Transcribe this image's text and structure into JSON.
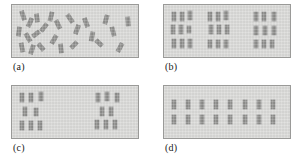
{
  "figure": {
    "background_color": "#ffffff",
    "panel_fill_color": "#d8d8d6",
    "panel_border_color": "#9a9a98",
    "mark_color": "#8c8c8a",
    "panel_width": 128,
    "panel_height": 54
  },
  "panels": [
    {
      "id": "a",
      "label": "(a)",
      "caption_text": "(a)",
      "pattern": "random",
      "origin": {
        "x": 11,
        "y": 4
      },
      "mark_count": 24,
      "marks": [
        {
          "x": 9,
          "y": 6,
          "w": 4,
          "h": 9,
          "rot": -18
        },
        {
          "x": 16,
          "y": 13,
          "w": 4,
          "h": 9,
          "rot": 24
        },
        {
          "x": 23,
          "y": 9,
          "w": 4,
          "h": 8,
          "rot": -8
        },
        {
          "x": 30,
          "y": 18,
          "w": 4,
          "h": 9,
          "rot": 38
        },
        {
          "x": 5,
          "y": 22,
          "w": 4,
          "h": 9,
          "rot": 8
        },
        {
          "x": 14,
          "y": 28,
          "w": 4,
          "h": 9,
          "rot": -30
        },
        {
          "x": 22,
          "y": 25,
          "w": 4,
          "h": 8,
          "rot": 52
        },
        {
          "x": 8,
          "y": 38,
          "w": 4,
          "h": 9,
          "rot": -12
        },
        {
          "x": 18,
          "y": 40,
          "w": 4,
          "h": 9,
          "rot": 18
        },
        {
          "x": 27,
          "y": 38,
          "w": 4,
          "h": 8,
          "rot": -40
        },
        {
          "x": 37,
          "y": 7,
          "w": 4,
          "h": 9,
          "rot": 14
        },
        {
          "x": 44,
          "y": 15,
          "w": 4,
          "h": 9,
          "rot": -26
        },
        {
          "x": 40,
          "y": 30,
          "w": 4,
          "h": 9,
          "rot": 30
        },
        {
          "x": 47,
          "y": 39,
          "w": 4,
          "h": 9,
          "rot": -6
        },
        {
          "x": 56,
          "y": 9,
          "w": 4,
          "h": 9,
          "rot": -34
        },
        {
          "x": 63,
          "y": 20,
          "w": 4,
          "h": 9,
          "rot": 20
        },
        {
          "x": 60,
          "y": 36,
          "w": 4,
          "h": 8,
          "rot": 44
        },
        {
          "x": 72,
          "y": 13,
          "w": 4,
          "h": 9,
          "rot": -20
        },
        {
          "x": 78,
          "y": 27,
          "w": 4,
          "h": 9,
          "rot": 10
        },
        {
          "x": 85,
          "y": 34,
          "w": 4,
          "h": 8,
          "rot": -46
        },
        {
          "x": 92,
          "y": 10,
          "w": 4,
          "h": 9,
          "rot": 16
        },
        {
          "x": 99,
          "y": 22,
          "w": 4,
          "h": 9,
          "rot": -14
        },
        {
          "x": 106,
          "y": 38,
          "w": 4,
          "h": 9,
          "rot": 28
        },
        {
          "x": 114,
          "y": 12,
          "w": 4,
          "h": 9,
          "rot": -4
        }
      ]
    },
    {
      "id": "b",
      "label": "(b)",
      "caption_text": "(b)",
      "pattern": "clustered-three-groups",
      "origin": {
        "x": 163,
        "y": 4
      },
      "mark_count": 27,
      "marks": [
        {
          "x": 8,
          "y": 7,
          "w": 4,
          "h": 9,
          "rot": 0
        },
        {
          "x": 16,
          "y": 7,
          "w": 4,
          "h": 9,
          "rot": 0
        },
        {
          "x": 24,
          "y": 6,
          "w": 4,
          "h": 9,
          "rot": 0
        },
        {
          "x": 7,
          "y": 20,
          "w": 4,
          "h": 9,
          "rot": 0
        },
        {
          "x": 15,
          "y": 20,
          "w": 4,
          "h": 9,
          "rot": 0
        },
        {
          "x": 23,
          "y": 21,
          "w": 4,
          "h": 7,
          "rot": 0
        },
        {
          "x": 8,
          "y": 34,
          "w": 4,
          "h": 9,
          "rot": 0
        },
        {
          "x": 16,
          "y": 34,
          "w": 4,
          "h": 9,
          "rot": 0
        },
        {
          "x": 24,
          "y": 34,
          "w": 4,
          "h": 9,
          "rot": 0
        },
        {
          "x": 44,
          "y": 7,
          "w": 4,
          "h": 9,
          "rot": 0
        },
        {
          "x": 52,
          "y": 7,
          "w": 4,
          "h": 9,
          "rot": 0
        },
        {
          "x": 60,
          "y": 6,
          "w": 4,
          "h": 9,
          "rot": 0
        },
        {
          "x": 45,
          "y": 20,
          "w": 4,
          "h": 9,
          "rot": 0
        },
        {
          "x": 53,
          "y": 20,
          "w": 4,
          "h": 9,
          "rot": 0
        },
        {
          "x": 61,
          "y": 20,
          "w": 4,
          "h": 9,
          "rot": 0
        },
        {
          "x": 44,
          "y": 35,
          "w": 4,
          "h": 8,
          "rot": 0
        },
        {
          "x": 52,
          "y": 35,
          "w": 4,
          "h": 8,
          "rot": 0
        },
        {
          "x": 60,
          "y": 35,
          "w": 4,
          "h": 8,
          "rot": 0
        },
        {
          "x": 90,
          "y": 7,
          "w": 4,
          "h": 9,
          "rot": 0
        },
        {
          "x": 98,
          "y": 7,
          "w": 4,
          "h": 9,
          "rot": 0
        },
        {
          "x": 108,
          "y": 7,
          "w": 4,
          "h": 9,
          "rot": 0
        },
        {
          "x": 90,
          "y": 21,
          "w": 4,
          "h": 9,
          "rot": 0
        },
        {
          "x": 99,
          "y": 21,
          "w": 4,
          "h": 9,
          "rot": 0
        },
        {
          "x": 108,
          "y": 21,
          "w": 4,
          "h": 9,
          "rot": 0
        },
        {
          "x": 90,
          "y": 35,
          "w": 4,
          "h": 8,
          "rot": 0
        },
        {
          "x": 98,
          "y": 35,
          "w": 4,
          "h": 8,
          "rot": 0
        },
        {
          "x": 106,
          "y": 35,
          "w": 4,
          "h": 8,
          "rot": 0
        }
      ]
    },
    {
      "id": "c",
      "label": "(c)",
      "caption_text": "(c)",
      "pattern": "clustered-two-groups",
      "origin": {
        "x": 11,
        "y": 85
      },
      "mark_count": 16,
      "marks": [
        {
          "x": 8,
          "y": 7,
          "w": 4,
          "h": 9,
          "rot": 0
        },
        {
          "x": 17,
          "y": 7,
          "w": 4,
          "h": 9,
          "rot": 0
        },
        {
          "x": 27,
          "y": 6,
          "w": 4,
          "h": 9,
          "rot": 0
        },
        {
          "x": 11,
          "y": 21,
          "w": 4,
          "h": 9,
          "rot": 0
        },
        {
          "x": 22,
          "y": 22,
          "w": 4,
          "h": 8,
          "rot": 0
        },
        {
          "x": 8,
          "y": 35,
          "w": 4,
          "h": 9,
          "rot": 0
        },
        {
          "x": 17,
          "y": 35,
          "w": 4,
          "h": 9,
          "rot": 0
        },
        {
          "x": 26,
          "y": 35,
          "w": 4,
          "h": 9,
          "rot": 0
        },
        {
          "x": 84,
          "y": 7,
          "w": 4,
          "h": 9,
          "rot": 0
        },
        {
          "x": 93,
          "y": 6,
          "w": 4,
          "h": 9,
          "rot": 0
        },
        {
          "x": 103,
          "y": 7,
          "w": 4,
          "h": 9,
          "rot": 0
        },
        {
          "x": 88,
          "y": 21,
          "w": 4,
          "h": 9,
          "rot": 0
        },
        {
          "x": 97,
          "y": 21,
          "w": 4,
          "h": 9,
          "rot": 0
        },
        {
          "x": 83,
          "y": 34,
          "w": 4,
          "h": 9,
          "rot": 0
        },
        {
          "x": 92,
          "y": 34,
          "w": 4,
          "h": 9,
          "rot": 0
        },
        {
          "x": 101,
          "y": 34,
          "w": 4,
          "h": 9,
          "rot": 0
        }
      ]
    },
    {
      "id": "d",
      "label": "(d)",
      "caption_text": "(d)",
      "pattern": "regular-grid",
      "origin": {
        "x": 163,
        "y": 85
      },
      "mark_count": 16,
      "grid": {
        "rows": 2,
        "cols": 8
      },
      "marks": [
        {
          "x": 8,
          "y": 14,
          "w": 4,
          "h": 9,
          "rot": 0
        },
        {
          "x": 22,
          "y": 14,
          "w": 4,
          "h": 9,
          "rot": 0
        },
        {
          "x": 36,
          "y": 14,
          "w": 4,
          "h": 9,
          "rot": 0
        },
        {
          "x": 50,
          "y": 14,
          "w": 4,
          "h": 9,
          "rot": 0
        },
        {
          "x": 64,
          "y": 14,
          "w": 4,
          "h": 9,
          "rot": 0
        },
        {
          "x": 79,
          "y": 14,
          "w": 4,
          "h": 9,
          "rot": 0
        },
        {
          "x": 93,
          "y": 14,
          "w": 4,
          "h": 9,
          "rot": 0
        },
        {
          "x": 107,
          "y": 14,
          "w": 4,
          "h": 9,
          "rot": 0
        },
        {
          "x": 8,
          "y": 29,
          "w": 4,
          "h": 9,
          "rot": 0
        },
        {
          "x": 22,
          "y": 29,
          "w": 4,
          "h": 9,
          "rot": 0
        },
        {
          "x": 36,
          "y": 29,
          "w": 4,
          "h": 9,
          "rot": 0
        },
        {
          "x": 50,
          "y": 29,
          "w": 4,
          "h": 9,
          "rot": 0
        },
        {
          "x": 64,
          "y": 29,
          "w": 4,
          "h": 9,
          "rot": 0
        },
        {
          "x": 79,
          "y": 29,
          "w": 4,
          "h": 9,
          "rot": 0
        },
        {
          "x": 93,
          "y": 29,
          "w": 4,
          "h": 9,
          "rot": 0
        },
        {
          "x": 107,
          "y": 29,
          "w": 4,
          "h": 9,
          "rot": 0
        }
      ]
    }
  ]
}
